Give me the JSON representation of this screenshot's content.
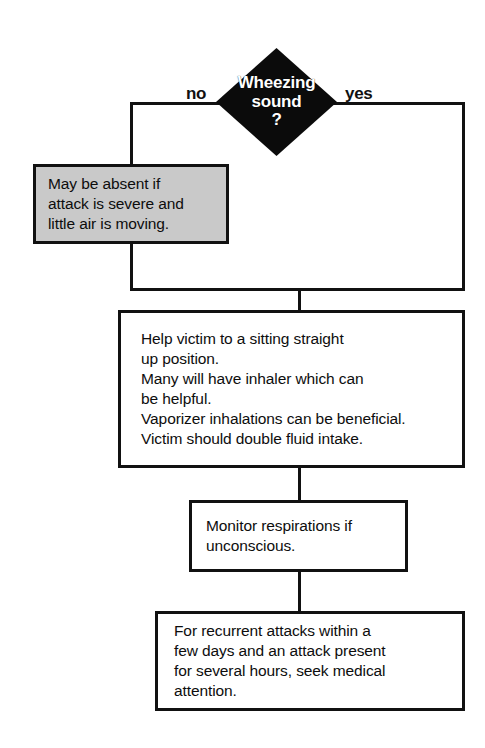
{
  "figure": {
    "kind": "flowchart"
  },
  "decision": {
    "label": "Wheezing\nsound\n?",
    "shape": "diamond",
    "fill_color": "#0b0b0b",
    "text_color": "#ffffff",
    "branch_no_label": "no",
    "branch_yes_label": "yes"
  },
  "nodes": {
    "note": {
      "text": "May be absent if\nattack is severe and\nlittle air is moving.",
      "fill_color": "#c9c9c9",
      "border_color": "#111111"
    },
    "help": {
      "text": "Help victim to a sitting straight\n     up position.\nMany will have inhaler which can\n     be helpful.\nVaporizer inhalations can be beneficial.\nVictim should double fluid intake.",
      "fill_color": "#ffffff",
      "border_color": "#111111"
    },
    "monitor": {
      "text": "Monitor respirations if\nunconscious.",
      "fill_color": "#ffffff",
      "border_color": "#111111"
    },
    "followup": {
      "text": "For recurrent attacks within a\nfew days and an attack present\nfor several hours, seek medical\nattention.",
      "fill_color": "#ffffff",
      "border_color": "#111111"
    }
  }
}
